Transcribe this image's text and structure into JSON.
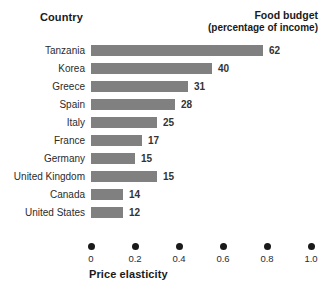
{
  "header": {
    "country_label": "Country",
    "budget_label_line1": "Food budget",
    "budget_label_line2": "(percentage of income)"
  },
  "axis": {
    "title": "Price elasticity",
    "ticks": [
      "0",
      "0.2",
      "0.4",
      "0.6",
      "0.8",
      "1.0"
    ]
  },
  "colors": {
    "bar": "#808080",
    "text": "#1a1a1a",
    "dot": "#1a1a1a",
    "background": "#ffffff"
  },
  "chart_data": {
    "type": "bar",
    "orientation": "horizontal",
    "title": "",
    "xlabel": "Price elasticity",
    "ylabel": "Country",
    "xlim": [
      0,
      1.0
    ],
    "xticks": [
      0,
      0.2,
      0.4,
      0.6,
      0.8,
      1.0
    ],
    "grid": false,
    "legend": false,
    "note": "Bar length encodes price elasticity; the printed number on each bar is the food budget as a percentage of income.",
    "categories": [
      "Tanzania",
      "Korea",
      "Greece",
      "Spain",
      "Italy",
      "France",
      "Germany",
      "United Kingdom",
      "Canada",
      "United States"
    ],
    "series": [
      {
        "name": "Price elasticity",
        "encoding": "bar-length",
        "values": [
          0.78,
          0.55,
          0.44,
          0.38,
          0.3,
          0.23,
          0.2,
          0.3,
          0.145,
          0.145
        ]
      },
      {
        "name": "Food budget (percentage of income)",
        "encoding": "data-label",
        "values": [
          62,
          40,
          31,
          28,
          25,
          17,
          15,
          15,
          14,
          12
        ]
      }
    ],
    "value_labels": [
      "62",
      "40",
      "31",
      "28",
      "25",
      "17",
      "15",
      "15",
      "14",
      "12"
    ]
  }
}
